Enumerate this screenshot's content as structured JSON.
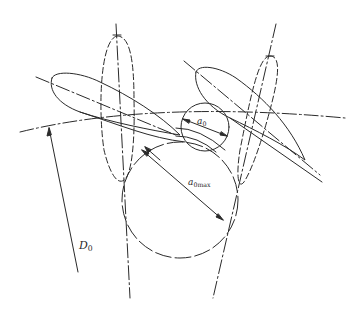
{
  "figure": {
    "stroke_color": "#2a2a2a",
    "background": "#ffffff"
  },
  "labels": {
    "throat_width": {
      "base": "a",
      "sub": "0"
    },
    "throat_width_max": {
      "base": "a",
      "sub": "0max"
    },
    "diameter": {
      "base": "D",
      "sub": "0"
    }
  },
  "elements": {
    "blades": [
      "left-blade-solid",
      "right-blade-solid"
    ],
    "dashed_blades": [
      "left-blade-dashed",
      "right-blade-dashed"
    ],
    "circles": [
      "throat-circle-a0",
      "throat-circle-a0max"
    ],
    "arc": "diameter-arc-D0"
  }
}
